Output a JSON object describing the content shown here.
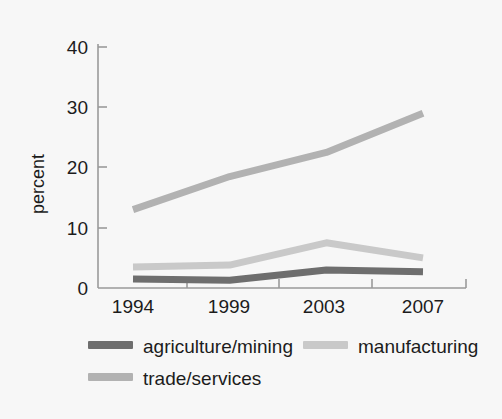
{
  "chart_data": {
    "type": "line",
    "title": "",
    "xlabel": "",
    "ylabel": "percent",
    "x": [
      1994,
      1999,
      2003,
      2007
    ],
    "categories": [
      "1994",
      "1999",
      "2003",
      "2007"
    ],
    "ylim": [
      0,
      42
    ],
    "yticks": [
      0,
      10,
      20,
      30,
      40
    ],
    "ytick_labels": [
      "0",
      "10",
      "20",
      "30",
      "40"
    ],
    "xtick_labels": [
      "1994",
      "1999",
      "2003",
      "2007"
    ],
    "grid": false,
    "legend_position": "below",
    "series": [
      {
        "name": "agriculture/mining",
        "color": "#6e6e6e",
        "values": [
          1.5,
          1.3,
          3.0,
          2.7
        ]
      },
      {
        "name": "manufacturing",
        "color": "#c9c9c9",
        "values": [
          3.5,
          3.8,
          7.5,
          5.0
        ]
      },
      {
        "name": "trade/services",
        "color": "#b2b2b2",
        "values": [
          13.0,
          18.5,
          22.5,
          29.0
        ]
      }
    ]
  },
  "axis": {
    "y_label": "percent",
    "y_tick_40": "40",
    "y_tick_30": "30",
    "y_tick_20": "20",
    "y_tick_10": "10",
    "y_tick_0": "0",
    "x_tick_1994": "1994",
    "x_tick_1999": "1999",
    "x_tick_2003": "2003",
    "x_tick_2007": "2007"
  },
  "legend": {
    "items": [
      {
        "label": "agriculture/mining",
        "color": "#6e6e6e"
      },
      {
        "label": "manufacturing",
        "color": "#c9c9c9"
      },
      {
        "label": "trade/services",
        "color": "#b2b2b2"
      }
    ]
  },
  "colors": {
    "background": "#f7f7f7",
    "axis": "#9a9a9a",
    "text": "#1c1c1c"
  }
}
